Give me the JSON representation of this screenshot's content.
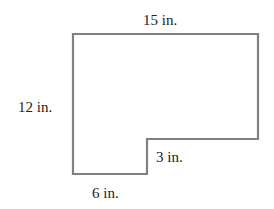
{
  "diagram": {
    "type": "composite-rectilinear-shape",
    "stroke_color": "#808080",
    "labels": {
      "top": "15 in.",
      "left": "12 in.",
      "notch_height": "3 in.",
      "bottom": "6 in."
    },
    "dimensions_in": {
      "width": 15,
      "height": 12,
      "notch_height": 3,
      "bottom_width": 6
    }
  }
}
